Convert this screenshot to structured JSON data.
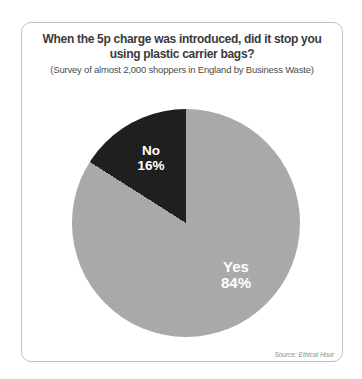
{
  "page": {
    "background_color": "#ffffff",
    "card_border_color": "#bfbfbf"
  },
  "chart_data": {
    "type": "pie",
    "title": "When the 5p charge was introduced, did it stop you using plastic carrier bags?",
    "subtitle": "(Survey of almost 2,000 shoppers in England by Business Waste)",
    "slices": [
      {
        "label": "Yes",
        "value": 84,
        "pct_label": "84%",
        "color": "#a9a9a9",
        "text_color": "#ffffff"
      },
      {
        "label": "No",
        "value": 16,
        "pct_label": "16%",
        "color": "#1f1f1f",
        "text_color": "#ffffff"
      }
    ],
    "no_slice_start_deg": 302.4,
    "legend": "none",
    "labels_position": "inside-slices",
    "source": "Source: Ethical Hour"
  }
}
